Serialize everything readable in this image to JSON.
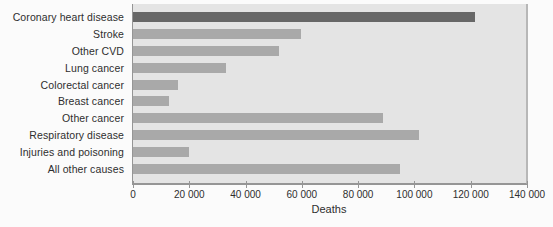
{
  "figure": {
    "page_background": "#fbfbfb"
  },
  "chart_data": {
    "type": "bar",
    "orientation": "horizontal",
    "title": "",
    "categories": [
      "Coronary heart disease",
      "Stroke",
      "Other CVD",
      "Lung cancer",
      "Colorectal cancer",
      "Breast cancer",
      "Other cancer",
      "Respiratory disease",
      "Injuries and poisoning",
      "All other causes"
    ],
    "values": [
      122000,
      60000,
      52000,
      33000,
      16000,
      13000,
      89000,
      102000,
      20000,
      95000
    ],
    "highlight_index": 0,
    "xlabel": "Deaths",
    "ylabel": "",
    "xlim": [
      0,
      140000
    ],
    "x_ticks": [
      0,
      20000,
      40000,
      60000,
      80000,
      100000,
      120000,
      140000
    ],
    "x_tick_labels": [
      "0",
      "20 000",
      "40 000",
      "60 000",
      "80 000",
      "100 000",
      "120 000",
      "140 000"
    ],
    "grid": false,
    "legend": false,
    "colors": {
      "highlight_bar": "#676767",
      "bar": "#a9a9a9",
      "plot_background": "#e4e4e4",
      "axis": "#959595",
      "plot_border_right": "#b7b7b7",
      "text": "#2e2e2e"
    }
  }
}
